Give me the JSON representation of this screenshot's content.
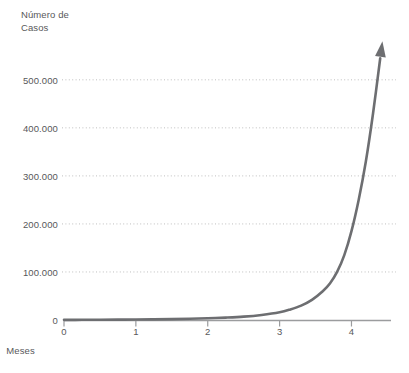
{
  "chart_data": {
    "type": "line",
    "title": "",
    "subtitle": "",
    "ylabel": "Número de\nCasos",
    "xlabel": "Meses",
    "xlim": [
      0,
      4.55
    ],
    "ylim": [
      0,
      560000
    ],
    "grid": true,
    "grid_axis": "y",
    "legend": "none",
    "annotations": [
      {
        "name": "arrowhead",
        "text": "",
        "description": "upward arrowhead at end of curve"
      }
    ],
    "x_ticks": [
      {
        "value": 0,
        "label": "0"
      },
      {
        "value": 1,
        "label": "1"
      },
      {
        "value": 2,
        "label": "2"
      },
      {
        "value": 3,
        "label": "3"
      },
      {
        "value": 4,
        "label": "4"
      }
    ],
    "y_ticks": [
      {
        "value": 0,
        "label": "0"
      },
      {
        "value": 100000,
        "label": "100.000"
      },
      {
        "value": 200000,
        "label": "200.000"
      },
      {
        "value": 300000,
        "label": "300.000"
      },
      {
        "value": 400000,
        "label": "400.000"
      },
      {
        "value": 500000,
        "label": "500.000"
      }
    ],
    "series": [
      {
        "name": "Casos",
        "color": "#6d6e71",
        "x": [
          0.0,
          0.25,
          0.5,
          0.75,
          1.0,
          1.25,
          1.5,
          1.75,
          2.0,
          2.25,
          2.5,
          2.75,
          3.0,
          3.15,
          3.3,
          3.45,
          3.6,
          3.7,
          3.8,
          3.9,
          4.0,
          4.1,
          4.2,
          4.3,
          4.4
        ],
        "y": [
          300,
          400,
          550,
          750,
          1000,
          1400,
          1900,
          2600,
          3600,
          5000,
          7000,
          10500,
          16000,
          22000,
          30000,
          42000,
          60000,
          76000,
          100000,
          135000,
          185000,
          250000,
          330000,
          430000,
          545000
        ]
      }
    ]
  },
  "colors": {
    "curve": "#6d6e71",
    "axis": "#9b9c9e",
    "grid": "#bfbfbf",
    "text": "#58585a",
    "background": "#ffffff"
  }
}
